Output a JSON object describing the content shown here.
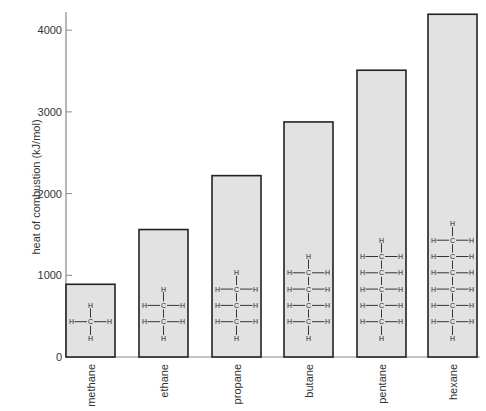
{
  "chart_data": {
    "type": "bar",
    "title": "",
    "xlabel": "",
    "ylabel": "heat of combustion (kJ/mol)",
    "categories": [
      "methane",
      "ethane",
      "propane",
      "butane",
      "pentane",
      "hexane"
    ],
    "values": [
      890,
      1560,
      2220,
      2877,
      3510,
      4195
    ],
    "carbon_counts": [
      1,
      2,
      3,
      4,
      5,
      6
    ],
    "ylim": [
      0,
      4200
    ],
    "yticks": [
      0,
      1000,
      2000,
      3000,
      4000
    ],
    "grid": false,
    "legend": null,
    "annotations": "Each bar contains a structural formula of the alkane (H-C-H chain)",
    "bar_fill": "#e2e2e2",
    "bar_stroke": "#222222",
    "axis_color": "#888888"
  }
}
